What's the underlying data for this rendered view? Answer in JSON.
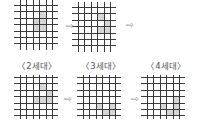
{
  "arrow_glyph": "⇨",
  "grid_style": {
    "line_color": "#3a3a3a",
    "shade_color": "#d6d6d6",
    "cell_size": 6.4,
    "v_lines": 6,
    "h_lines": 7
  },
  "grids": [
    {
      "id": "top-1",
      "left": 14,
      "top": 0,
      "v_start": 6,
      "h_start": 5,
      "label": "",
      "shaded": [
        [
          3,
          1
        ],
        [
          2,
          2
        ],
        [
          3,
          2
        ],
        [
          2,
          3
        ],
        [
          3,
          3
        ]
      ]
    },
    {
      "id": "top-2",
      "left": 72,
      "top": 2,
      "v_start": 6,
      "h_start": 5,
      "label": "",
      "shaded": [
        [
          3,
          1
        ],
        [
          4,
          2
        ],
        [
          3,
          3
        ],
        [
          4,
          3
        ]
      ]
    },
    {
      "id": "gen-2",
      "left": 14,
      "top": 75,
      "v_start": 6,
      "h_start": 2,
      "label": "〈2세대〉",
      "shaded": [
        [
          3,
          1
        ],
        [
          4,
          2
        ],
        [
          2,
          3
        ],
        [
          3,
          3
        ],
        [
          4,
          3
        ]
      ]
    },
    {
      "id": "gen-3",
      "left": 77,
      "top": 75,
      "v_start": 6,
      "h_start": 2,
      "label": "〈3세대〉",
      "shaded": [
        [
          2,
          4
        ],
        [
          4,
          4
        ],
        [
          3,
          5
        ],
        [
          4,
          5
        ]
      ]
    },
    {
      "id": "gen-4",
      "left": 141,
      "top": 75,
      "v_start": 6,
      "h_start": 2,
      "label": "〈4세대〉",
      "shaded": [
        [
          4,
          3
        ],
        [
          2,
          4
        ],
        [
          4,
          4
        ],
        [
          3,
          5
        ],
        [
          4,
          5
        ]
      ]
    }
  ],
  "labels": [
    {
      "text": "〈2세대〉",
      "x": 37,
      "y": 61
    },
    {
      "text": "〈3세대〉",
      "x": 101,
      "y": 61
    },
    {
      "text": "〈4세대〉",
      "x": 166,
      "y": 61
    }
  ],
  "arrows": [
    {
      "x": 66,
      "y": 22
    },
    {
      "x": 126,
      "y": 21
    },
    {
      "x": 64,
      "y": 95
    },
    {
      "x": 131,
      "y": 95
    }
  ]
}
